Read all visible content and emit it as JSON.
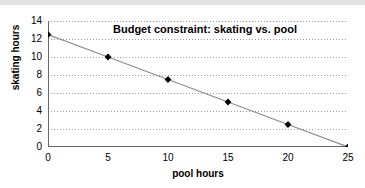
{
  "chart_data": {
    "type": "line",
    "title": "Budget constraint: skating vs. pool",
    "xlabel": "pool hours",
    "ylabel": "skating hours",
    "x": [
      0,
      5,
      10,
      15,
      20,
      25
    ],
    "values": [
      12.5,
      10,
      7.5,
      5,
      2.5,
      0
    ],
    "series": [
      {
        "name": "budget constraint",
        "x": [
          0,
          5,
          10,
          15,
          20,
          25
        ],
        "values": [
          12.5,
          10,
          7.5,
          5,
          2.5,
          0
        ]
      }
    ],
    "xlim": [
      0,
      25
    ],
    "ylim": [
      0,
      14
    ],
    "xticks": [
      0,
      5,
      10,
      15,
      20,
      25
    ],
    "yticks": [
      0,
      2,
      4,
      6,
      8,
      10,
      12,
      14
    ],
    "xtick_labels": [
      "0",
      "5",
      "10",
      "15",
      "20",
      "25"
    ],
    "ytick_labels": [
      "0",
      "2",
      "4",
      "6",
      "8",
      "10",
      "12",
      "14"
    ],
    "grid": "horizontal-dotted",
    "legend": "none",
    "marker": "diamond",
    "marker_color": "#000000",
    "line_color": "#8c8c8c",
    "grid_color": "#9a9a9a",
    "axis_color": "#666666",
    "background": "#ffffff",
    "top_band_color": "#e2e2e2"
  }
}
